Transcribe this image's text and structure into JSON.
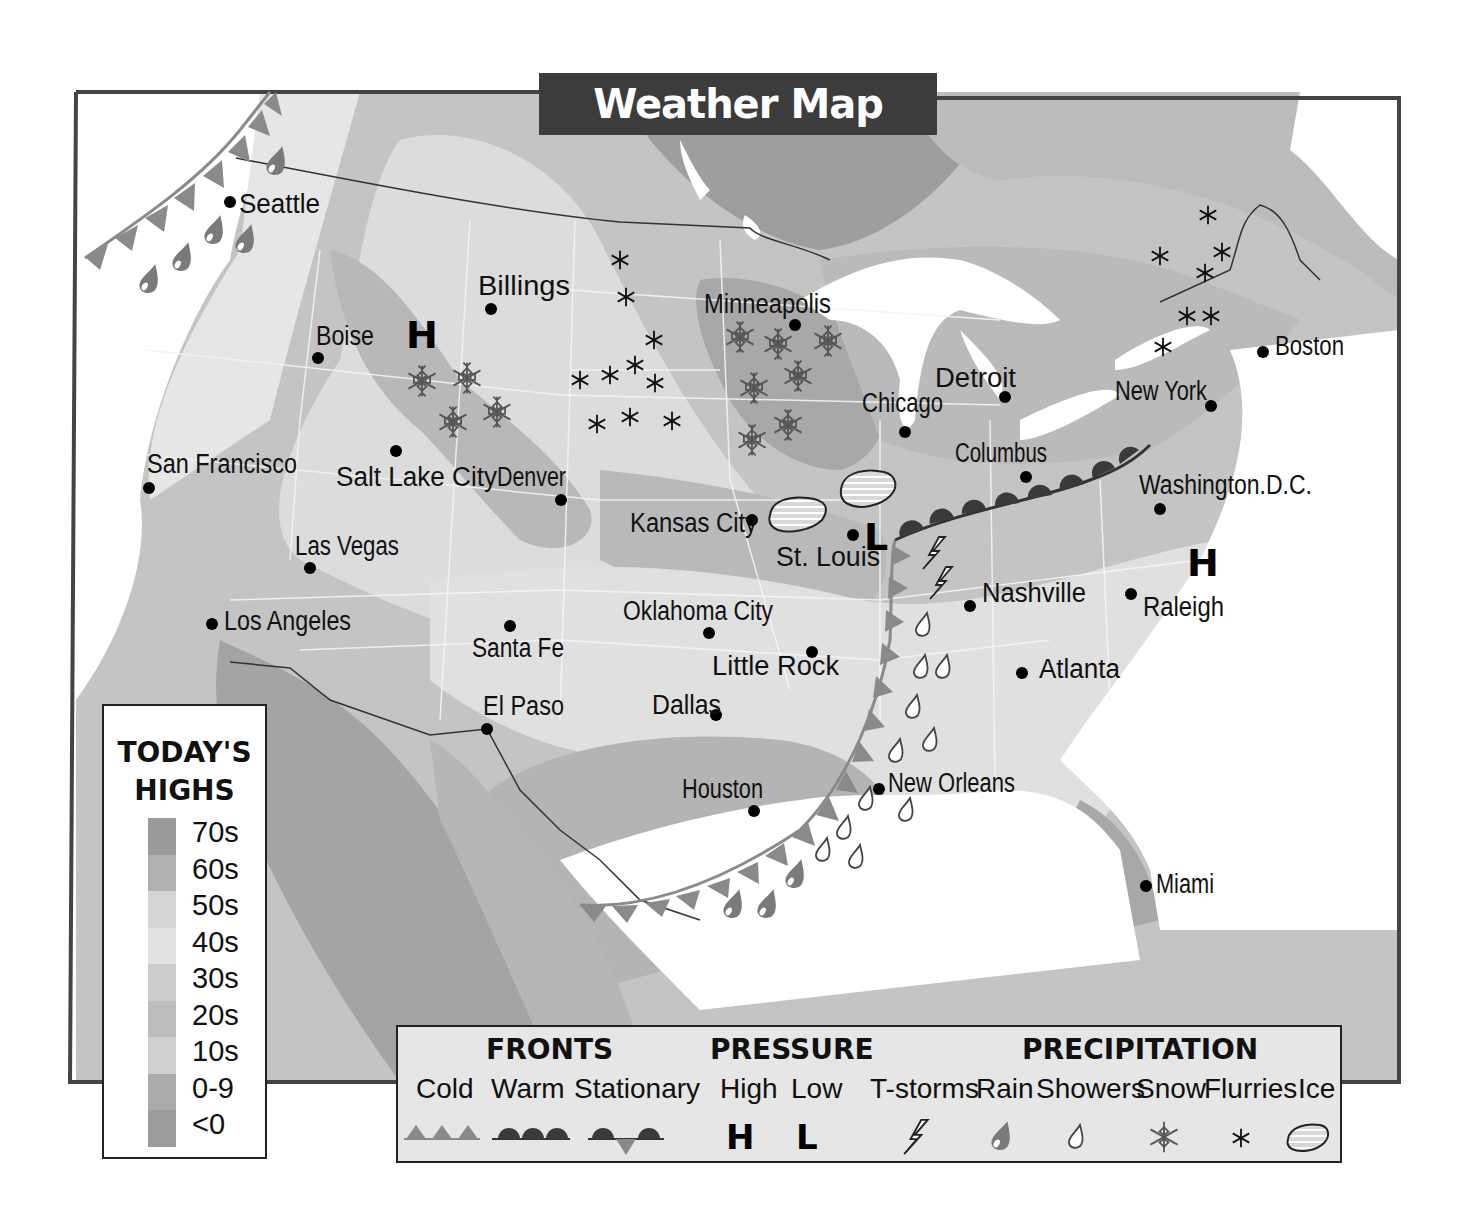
{
  "title": "Weather Map",
  "colors": {
    "frame": "#444444",
    "title_bg": "#3c3c3c",
    "cold_front": "#8a8a8a",
    "warm_front": "#3a3a3a",
    "rain_drop": "#7a7a7a",
    "band_70s": "#9a9a9a",
    "band_60s": "#b0b0b0",
    "band_50s": "#d4d4d4",
    "band_40s": "#e2e2e2",
    "band_30s": "#cdcdcd",
    "band_20s": "#bdbdbd",
    "band_10s": "#d0d0d0",
    "band_0_9": "#ababab",
    "band_lt0": "#9c9c9c"
  },
  "cities": [
    {
      "name": "Seattle",
      "dot": [
        230,
        202
      ],
      "label": [
        239,
        213
      ]
    },
    {
      "name": "Billings",
      "dot": [
        491,
        309
      ],
      "label": [
        478,
        295
      ]
    },
    {
      "name": "Boise",
      "dot": [
        318,
        358
      ],
      "label": [
        316,
        345
      ]
    },
    {
      "name": "Minneapolis",
      "dot": [
        795,
        325
      ],
      "label": [
        704,
        313
      ]
    },
    {
      "name": "Boston",
      "dot": [
        1263,
        352
      ],
      "label": [
        1275,
        355
      ]
    },
    {
      "name": "Detroit",
      "dot": [
        1005,
        397
      ],
      "label": [
        935,
        387
      ]
    },
    {
      "name": "Chicago",
      "dot": [
        905,
        432
      ],
      "label": [
        862,
        412
      ]
    },
    {
      "name": "New York",
      "dot": [
        1211,
        406
      ],
      "label": [
        1115,
        400
      ]
    },
    {
      "name": "San Francisco",
      "dot": [
        149,
        488
      ],
      "label": [
        147,
        473
      ]
    },
    {
      "name": "Salt Lake City",
      "dot": [
        396,
        451
      ],
      "label": [
        336,
        486
      ]
    },
    {
      "name": "Denver",
      "dot": [
        561,
        500
      ],
      "label": [
        497,
        486
      ]
    },
    {
      "name": "Columbus",
      "dot": [
        1026,
        477
      ],
      "label": [
        955,
        462
      ]
    },
    {
      "name": "Washington.D.C.",
      "dot": [
        1160,
        509
      ],
      "label": [
        1139,
        494
      ]
    },
    {
      "name": "Kansas City",
      "dot": [
        752,
        520
      ],
      "label": [
        630,
        532
      ]
    },
    {
      "name": "St. Louis",
      "dot": [
        853,
        535
      ],
      "label": [
        776,
        566
      ]
    },
    {
      "name": "Las Vegas",
      "dot": [
        310,
        568
      ],
      "label": [
        295,
        555
      ]
    },
    {
      "name": "Nashville",
      "dot": [
        970,
        606
      ],
      "label": [
        982,
        602
      ]
    },
    {
      "name": "Raleigh",
      "dot": [
        1131,
        594
      ],
      "label": [
        1143,
        616
      ]
    },
    {
      "name": "Los Angeles",
      "dot": [
        212,
        624
      ],
      "label": [
        224,
        630
      ]
    },
    {
      "name": "Oklahoma City",
      "dot": [
        709,
        633
      ],
      "label": [
        623,
        620
      ]
    },
    {
      "name": "Santa Fe",
      "dot": [
        510,
        626
      ],
      "label": [
        472,
        657
      ]
    },
    {
      "name": "Little Rock",
      "dot": [
        812,
        652
      ],
      "label": [
        712,
        675
      ]
    },
    {
      "name": "Atlanta",
      "dot": [
        1022,
        673
      ],
      "label": [
        1039,
        678
      ]
    },
    {
      "name": "El Paso",
      "dot": [
        487,
        729
      ],
      "label": [
        483,
        715
      ]
    },
    {
      "name": "Dallas",
      "dot": [
        716,
        715
      ],
      "label": [
        652,
        714
      ]
    },
    {
      "name": "Houston",
      "dot": [
        754,
        811
      ],
      "label": [
        682,
        798
      ]
    },
    {
      "name": "New Orleans",
      "dot": [
        879,
        789
      ],
      "label": [
        888,
        792
      ]
    },
    {
      "name": "Miami",
      "dot": [
        1146,
        886
      ],
      "label": [
        1156,
        893
      ]
    }
  ],
  "pressure_centers": [
    {
      "type": "High",
      "symbol": "H",
      "pos": [
        422,
        348
      ]
    },
    {
      "type": "Low",
      "symbol": "L",
      "pos": [
        877,
        548
      ]
    },
    {
      "type": "High",
      "symbol": "H",
      "pos": [
        1203,
        575
      ]
    }
  ],
  "todays_highs": {
    "title_line1": "TODAY'S",
    "title_line2": "HIGHS",
    "bands": [
      {
        "label": "70s",
        "color": "#9a9a9a"
      },
      {
        "label": "60s",
        "color": "#b0b0b0"
      },
      {
        "label": "50s",
        "color": "#d4d4d4"
      },
      {
        "label": "40s",
        "color": "#e2e2e2"
      },
      {
        "label": "30s",
        "color": "#cdcdcd"
      },
      {
        "label": "20s",
        "color": "#bdbdbd"
      },
      {
        "label": "10s",
        "color": "#d0d0d0"
      },
      {
        "label": "0-9",
        "color": "#ababab"
      },
      {
        "label": "<0",
        "color": "#9c9c9c"
      }
    ]
  },
  "legend": {
    "fronts": {
      "heading": "FRONTS",
      "items": [
        {
          "label": "Cold",
          "icon": "cold-front-triangles"
        },
        {
          "label": "Warm",
          "icon": "warm-front-semicircles"
        },
        {
          "label": "Stationary",
          "icon": "stationary-front"
        }
      ]
    },
    "pressure": {
      "heading": "PRESSURE",
      "items": [
        {
          "label": "High",
          "symbol": "H"
        },
        {
          "label": "Low",
          "symbol": "L"
        }
      ]
    },
    "precipitation": {
      "heading": "PRECIPITATION",
      "items": [
        {
          "label": "T-storms",
          "icon": "lightning-bolt"
        },
        {
          "label": "Rain",
          "icon": "filled-raindrop"
        },
        {
          "label": "Showers",
          "icon": "outline-raindrop"
        },
        {
          "label": "Snow",
          "icon": "snowflake"
        },
        {
          "label": "Flurries",
          "icon": "asterisk"
        },
        {
          "label": "Ice",
          "icon": "hatched-blob"
        }
      ]
    }
  },
  "precipitation_markers": {
    "snow": [
      [
        422,
        381
      ],
      [
        467,
        378
      ],
      [
        453,
        422
      ],
      [
        497,
        412
      ],
      [
        740,
        337
      ],
      [
        778,
        344
      ],
      [
        828,
        341
      ],
      [
        754,
        388
      ],
      [
        798,
        376
      ],
      [
        752,
        440
      ],
      [
        788,
        425
      ]
    ],
    "flurries": [
      [
        620,
        260
      ],
      [
        626,
        297
      ],
      [
        654,
        340
      ],
      [
        580,
        380
      ],
      [
        610,
        375
      ],
      [
        635,
        365
      ],
      [
        655,
        383
      ],
      [
        597,
        424
      ],
      [
        630,
        417
      ],
      [
        672,
        421
      ],
      [
        1208,
        215
      ],
      [
        1160,
        256
      ],
      [
        1222,
        252
      ],
      [
        1205,
        273
      ],
      [
        1187,
        316
      ],
      [
        1211,
        316
      ],
      [
        1163,
        347
      ]
    ],
    "rain": [
      [
        150,
        280
      ],
      [
        183,
        258
      ],
      [
        215,
        231
      ],
      [
        245,
        240
      ],
      [
        276,
        162
      ],
      [
        733,
        905
      ],
      [
        767,
        905
      ],
      [
        795,
        875
      ]
    ],
    "showers": [
      [
        923,
        625
      ],
      [
        921,
        667
      ],
      [
        943,
        667
      ],
      [
        913,
        707
      ],
      [
        930,
        740
      ],
      [
        896,
        751
      ],
      [
        866,
        799
      ],
      [
        844,
        828
      ],
      [
        823,
        850
      ],
      [
        856,
        857
      ],
      [
        906,
        810
      ]
    ],
    "tstorms": [
      [
        935,
        553
      ],
      [
        942,
        583
      ]
    ],
    "ice": [
      [
        797,
        517
      ],
      [
        867,
        494
      ]
    ]
  }
}
